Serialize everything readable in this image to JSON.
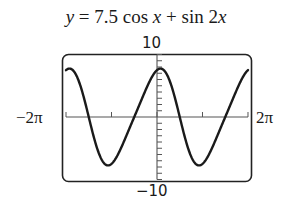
{
  "chart_data": {
    "type": "line",
    "title": "y = 7.5 cos x + sin 2x",
    "function": "7.5*cos(x) + sin(2*x)",
    "xlabel": "",
    "ylabel": "",
    "xlim": [
      -6.2832,
      6.2832
    ],
    "ylim": [
      -10,
      10
    ],
    "x_tick_labels": {
      "min": "−2π",
      "max": "2π"
    },
    "y_tick_labels": {
      "min": "−10",
      "max": "10"
    },
    "x_tick_step": "π",
    "y_tick_step": 1,
    "grid": false,
    "legend": null,
    "series": [
      {
        "name": "y = 7.5 cos x + sin 2x",
        "x": [
          -6.283,
          -5.498,
          -4.712,
          -3.927,
          -3.142,
          -2.356,
          -1.571,
          -0.785,
          0,
          0.785,
          1.571,
          2.356,
          3.142,
          3.927,
          4.712,
          5.498,
          6.283
        ],
        "y": [
          7.5,
          6.3,
          0,
          -6.3,
          -7.5,
          -4.3,
          0,
          4.3,
          7.5,
          6.3,
          0,
          -6.3,
          -7.5,
          -4.3,
          0,
          4.3,
          7.5
        ]
      }
    ]
  },
  "labels": {
    "title_y": "y",
    "title_eq": " = 7.5 cos ",
    "title_x1": "x",
    "title_plus": " + sin 2",
    "title_x2": "x",
    "ymax": "10",
    "ymin": "−10",
    "xmin": "−2π",
    "xmax": "2π"
  },
  "colors": {
    "curve": "#1a1a1a",
    "axes": "#555555",
    "frame": "#222222"
  }
}
